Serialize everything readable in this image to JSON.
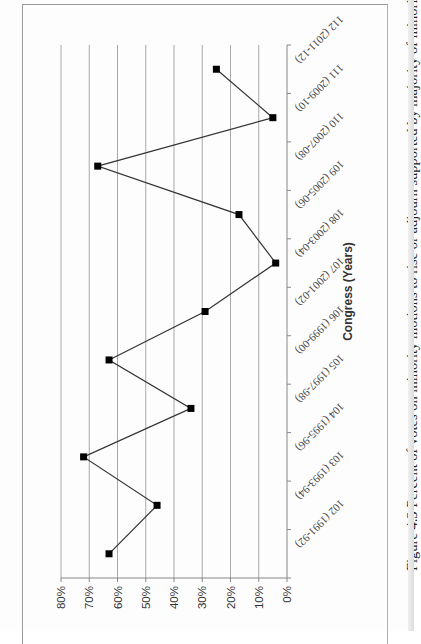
{
  "caption": "Figure 4.3 Percent of votes on minority motions to rise or adjourn supported by majority of minority",
  "chart_data": {
    "type": "line",
    "orientation": "rotated-90-clockwise",
    "title": "",
    "xlabel": "Congress (Years)",
    "ylabel": "",
    "categories": [
      "102 (1991-92)",
      "103 (1993-94)",
      "104 (1995-96)",
      "105 (1997-98)",
      "106 (1999-00)",
      "107 (2001-02)",
      "108 (2003-04)",
      "109 (2005-06)",
      "110 (2007-08)",
      "111 (2009-10)",
      "112 (2011-12)"
    ],
    "series": [
      {
        "name": "Percent supported by majority of minority",
        "values": [
          63,
          46,
          72,
          34,
          63,
          29,
          4,
          17,
          67,
          5,
          25
        ],
        "marker": "square",
        "color": "#000000"
      }
    ],
    "yticks": [
      "0%",
      "10%",
      "20%",
      "30%",
      "40%",
      "50%",
      "60%",
      "70%",
      "80%"
    ],
    "ylim": [
      0,
      80
    ],
    "grid": true,
    "legend": "none"
  }
}
